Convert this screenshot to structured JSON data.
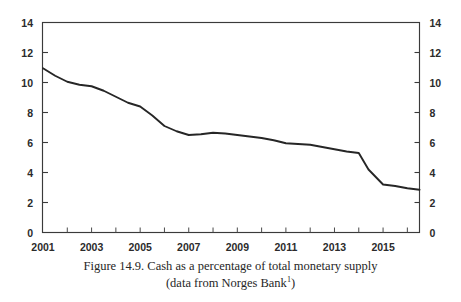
{
  "figure": {
    "caption_line_1": "Figure 14.9. Cash as a percentage of total monetary supply",
    "caption_line_2_prefix": "(data from Norges Bank",
    "caption_footnote_marker": "1",
    "caption_line_2_suffix": ")"
  },
  "chart_data": {
    "type": "line",
    "title": "Figure 14.9. Cash as a percentage of total monetary supply",
    "subtitle": "(data from Norges Bank1)",
    "xlabel": "",
    "ylabel": "",
    "xlim": [
      2001,
      2016.5
    ],
    "ylim": [
      0,
      14
    ],
    "grid": false,
    "legend": "none",
    "y_ticks": [
      0,
      2,
      4,
      6,
      8,
      10,
      12,
      14
    ],
    "y_tick_labels": [
      "0",
      "2",
      "4",
      "6",
      "8",
      "10",
      "12",
      "14"
    ],
    "y_axis_right_mirrored": true,
    "x_ticks": [
      2001,
      2002,
      2003,
      2004,
      2005,
      2006,
      2007,
      2008,
      2009,
      2010,
      2011,
      2012,
      2013,
      2014,
      2015,
      2016
    ],
    "x_tick_labels_shown": [
      "2001",
      "2003",
      "2005",
      "2007",
      "2009",
      "2011",
      "2013",
      "2015"
    ],
    "x_tick_labels_shown_at": [
      2001,
      2003,
      2005,
      2007,
      2009,
      2011,
      2013,
      2015
    ],
    "series": [
      {
        "name": "Cash as a percentage of total monetary supply",
        "color": "#262626",
        "x": [
          2001.0,
          2001.5,
          2002.0,
          2002.5,
          2003.0,
          2003.5,
          2004.0,
          2004.5,
          2005.0,
          2005.5,
          2006.0,
          2006.5,
          2007.0,
          2007.5,
          2008.0,
          2008.5,
          2009.0,
          2009.5,
          2010.0,
          2010.5,
          2011.0,
          2011.5,
          2012.0,
          2012.5,
          2013.0,
          2013.5,
          2014.0,
          2014.4,
          2015.0,
          2015.5,
          2016.0,
          2016.5
        ],
        "values": [
          10.95,
          10.45,
          10.05,
          9.85,
          9.75,
          9.45,
          9.05,
          8.65,
          8.4,
          7.8,
          7.1,
          6.75,
          6.5,
          6.55,
          6.65,
          6.6,
          6.5,
          6.4,
          6.3,
          6.15,
          5.95,
          5.9,
          5.85,
          5.7,
          5.55,
          5.4,
          5.3,
          4.2,
          3.2,
          3.1,
          2.95,
          2.85
        ]
      }
    ]
  }
}
